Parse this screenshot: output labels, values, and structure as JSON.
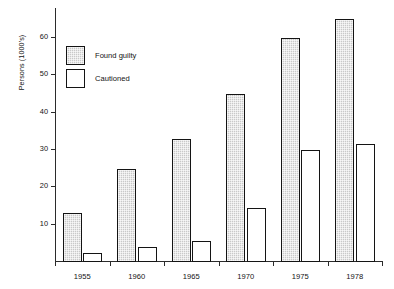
{
  "chart_data": {
    "type": "bar",
    "title": "",
    "xlabel": "",
    "ylabel": "Persons (1000's)",
    "categories": [
      "1955",
      "1960",
      "1965",
      "1970",
      "1975",
      "1978"
    ],
    "series": [
      {
        "name": "Found guilty",
        "values": [
          13,
          25,
          33,
          45,
          60,
          65
        ],
        "color": "#c9c9c9"
      },
      {
        "name": "Cautioned",
        "values": [
          2.5,
          4,
          5.5,
          14.5,
          30,
          31.5
        ],
        "color": "#ffffff"
      }
    ],
    "ylim": [
      0,
      68
    ],
    "yticks": [
      10,
      20,
      30,
      40,
      50,
      60
    ],
    "ytick_labels": [
      "10",
      "20",
      "30",
      "40",
      "50",
      "60"
    ],
    "grid": false,
    "legend_position": "upper left"
  },
  "legend": {
    "items": [
      {
        "label": "Found guilty"
      },
      {
        "label": "Cautioned"
      }
    ]
  }
}
